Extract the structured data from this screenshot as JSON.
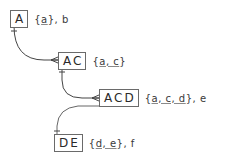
{
  "nodes": [
    {
      "id": "A",
      "label": "A",
      "key": "a",
      "rest": ", b",
      "x": 10,
      "y": 10
    },
    {
      "id": "AC",
      "label": "AC",
      "key": "a, c",
      "rest": "",
      "x": 58,
      "y": 52
    },
    {
      "id": "ACD",
      "label": "ACD",
      "key": "a, c, d",
      "rest": ", e",
      "x": 99,
      "y": 89
    },
    {
      "id": "DE",
      "label": "DE",
      "key": "d, e",
      "rest": ", f",
      "x": 54,
      "y": 134
    }
  ],
  "edges": [
    {
      "from": "A",
      "to": "AC",
      "from_end": "one",
      "to_end": "many"
    },
    {
      "from": "AC",
      "to": "ACD",
      "from_end": "one",
      "to_end": "many"
    },
    {
      "from": "ACD",
      "to": "DE",
      "from_end": "line",
      "to_end": "one"
    }
  ],
  "colors": {
    "line": "#444444",
    "box_border": "#6a6a6a",
    "text": "#2a2a2a"
  },
  "text": {
    "open": "{",
    "close": "}"
  }
}
